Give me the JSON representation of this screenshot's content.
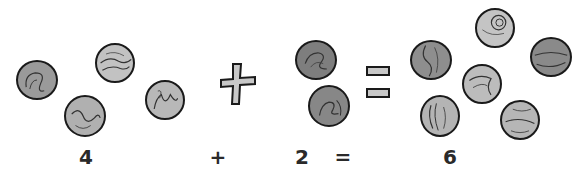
{
  "equation": {
    "terms": [
      {
        "label": "4",
        "count": 4
      },
      {
        "operator": "+"
      },
      {
        "label": "2",
        "count": 2
      },
      {
        "operator": "="
      },
      {
        "label": "6",
        "count": 6
      }
    ],
    "labels": {
      "left": "4",
      "plus": "+",
      "middle": "2",
      "equals": "=",
      "result": "6"
    }
  },
  "colors": {
    "marble_light": "#bdbdbd",
    "marble_dark": "#8a8a8a",
    "outline": "#1a1a1a",
    "symbol_fill": "#c8c8c8",
    "text": "#2a2a2a"
  }
}
